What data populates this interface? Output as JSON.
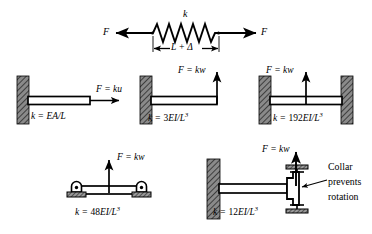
{
  "figure": {
    "type": "engineering-diagram",
    "background": "#ffffff",
    "ink": "#000000",
    "wall_fill": "#808080"
  },
  "spring": {
    "stiffness_label": "k",
    "force_left_label": "F",
    "force_right_label": "F",
    "dimension_label": "L + Δ",
    "coils": 9
  },
  "cases": [
    {
      "id": "axial-bar",
      "support": "fixed-wall-left",
      "force_label": "F = ku",
      "force_direction": "horizontal-right",
      "stiffness_prefix": "k = ",
      "stiffness_numerator": "EA",
      "stiffness_denominator": "L",
      "stiffness_exponent": "",
      "stiffness_text": "k = EA/L"
    },
    {
      "id": "cantilever-tip-load",
      "support": "fixed-wall-left",
      "force_label": "F = kw",
      "force_direction": "vertical-up",
      "stiffness_prefix": "k = ",
      "stiffness_coefficient": "3",
      "stiffness_numerator": "EI",
      "stiffness_denominator": "L",
      "stiffness_exponent": "3",
      "stiffness_text": "k = 3EI/L3"
    },
    {
      "id": "fixed-fixed-center-load",
      "support": "fixed-wall-both-ends",
      "force_label": "F = kw",
      "force_direction": "vertical-up",
      "stiffness_prefix": "k = ",
      "stiffness_coefficient": "192",
      "stiffness_numerator": "EI",
      "stiffness_denominator": "L",
      "stiffness_exponent": "3",
      "stiffness_text": "k = 192EI/L3"
    },
    {
      "id": "simply-supported-center-load",
      "support": "pinned-both-ends",
      "force_label": "F = kw",
      "force_direction": "vertical-up",
      "stiffness_prefix": "k = ",
      "stiffness_coefficient": "48",
      "stiffness_numerator": "EI",
      "stiffness_denominator": "L",
      "stiffness_exponent": "3",
      "stiffness_text": "k = 48EI/L3"
    },
    {
      "id": "cantilever-guided-collar",
      "support": "fixed-wall-left-collar-right",
      "force_label": "F = kw",
      "force_direction": "vertical-up",
      "stiffness_prefix": "k = ",
      "stiffness_coefficient": "12",
      "stiffness_numerator": "EI",
      "stiffness_denominator": "L",
      "stiffness_exponent": "3",
      "stiffness_text": "k = 12EI/L3",
      "annotation_lines": [
        "Collar",
        "prevents",
        "rotation"
      ]
    }
  ]
}
